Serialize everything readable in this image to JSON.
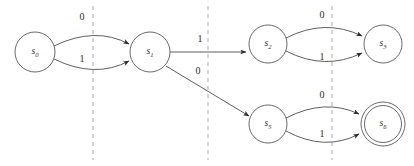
{
  "diagram": {
    "type": "state-transition-diagram",
    "title": "",
    "background_color": "#ffffff",
    "node_stroke_color": "#59595c",
    "edge_color": "#4e4e51",
    "divider_color": "#a9a9b0",
    "label_color": "#2b2b2d",
    "states": [
      {
        "id": "s0",
        "name": "s",
        "subscript": "0",
        "cx": 35,
        "cy": 52,
        "r": 20,
        "accepting": false
      },
      {
        "id": "s1",
        "name": "s",
        "subscript": "1",
        "cx": 150,
        "cy": 52,
        "r": 20,
        "accepting": false
      },
      {
        "id": "s2",
        "name": "s",
        "subscript": "2",
        "cx": 268,
        "cy": 44,
        "r": 19,
        "accepting": false
      },
      {
        "id": "s3",
        "name": "s",
        "subscript": "3",
        "cx": 383,
        "cy": 44,
        "r": 19,
        "accepting": false
      },
      {
        "id": "s5",
        "name": "s",
        "subscript": "5",
        "cx": 268,
        "cy": 124,
        "r": 19,
        "accepting": false
      },
      {
        "id": "s6",
        "name": "s",
        "subscript": "6",
        "cx": 383,
        "cy": 124,
        "r": 18.5,
        "accepting": true,
        "outer_r": 22
      }
    ],
    "transitions": [
      {
        "id": "t-s0-s1-0",
        "from": "s0",
        "to": "s1",
        "label": "0",
        "label_x": 82,
        "label_y": 18,
        "path": "M 54 46 Q 95 26 129 44"
      },
      {
        "id": "t-s0-s1-1",
        "from": "s0",
        "to": "s1",
        "label": "1",
        "label_x": 82,
        "label_y": 60,
        "path": "M 54 59 Q 95 79 129 61"
      },
      {
        "id": "t-s1-s2-1",
        "from": "s1",
        "to": "s2",
        "label": "1",
        "label_x": 200,
        "label_y": 40,
        "path": "M 170 52 L 246 52"
      },
      {
        "id": "t-s1-s5-0",
        "from": "s1",
        "to": "s5",
        "label": "0",
        "label_x": 198,
        "label_y": 72,
        "path": "M 166 66 L 249 116"
      },
      {
        "id": "t-s2-s3-0",
        "from": "s2",
        "to": "s3",
        "label": "0",
        "label_x": 322,
        "label_y": 16,
        "path": "M 286 38 Q 325 18 362 36"
      },
      {
        "id": "t-s2-s3-1",
        "from": "s2",
        "to": "s3",
        "label": "1",
        "label_x": 322,
        "label_y": 58,
        "path": "M 286 51 Q 325 71 362 53"
      },
      {
        "id": "t-s5-s6-0",
        "from": "s5",
        "to": "s6",
        "label": "0",
        "label_x": 322,
        "label_y": 96,
        "path": "M 286 118 Q 325 98 359 114"
      },
      {
        "id": "t-s5-s6-1",
        "from": "s5",
        "to": "s6",
        "label": "1",
        "label_x": 322,
        "label_y": 135,
        "path": "M 286 131 Q 325 152 359 134"
      }
    ],
    "stage_dividers": [
      {
        "id": "divider-1",
        "x": 93,
        "y1": 6,
        "y2": 160
      },
      {
        "id": "divider-2",
        "x": 208,
        "y1": 6,
        "y2": 160
      },
      {
        "id": "divider-3",
        "x": 332,
        "y1": 6,
        "y2": 160
      }
    ]
  }
}
